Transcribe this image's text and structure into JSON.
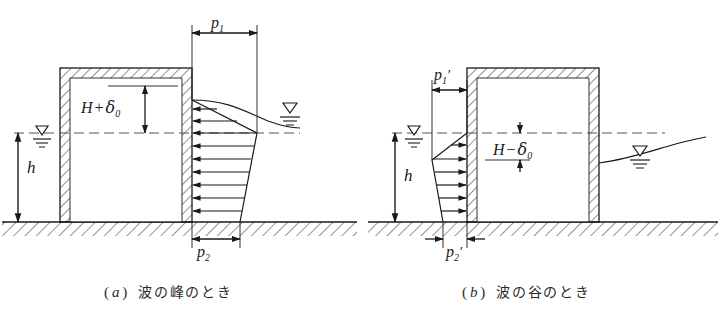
{
  "figure": {
    "title_visible": false,
    "background_color": "#ffffff",
    "line_color": "#1a1a1a"
  },
  "panel_a": {
    "caption_paren_open": "(",
    "caption_letter": "a",
    "caption_paren_close": ")",
    "caption_text": "波の峰のとき",
    "labels": {
      "p1": "p",
      "p1_sub": "1",
      "p2": "p",
      "p2_sub": "2",
      "h": "h",
      "H_term": "H",
      "operator": "+",
      "delta": "δ",
      "delta_sub": "0"
    },
    "symbols": {
      "left_water_level": "water-level-triangle",
      "right_water_level": "water-level-triangle",
      "still_water_line": "dashed",
      "ground": "hatched-ground",
      "structure": "hatched-caisson"
    }
  },
  "panel_b": {
    "caption_paren_open": "(",
    "caption_letter": "b",
    "caption_paren_close": ")",
    "caption_text": "波の谷のとき",
    "labels": {
      "p1": "p",
      "p1_sub": "1",
      "p1_prime": "′",
      "p2": "p",
      "p2_sub": "2",
      "p2_prime": "′",
      "h": "h",
      "H_term": "H",
      "operator": "−",
      "delta": "δ",
      "delta_sub": "0"
    },
    "symbols": {
      "left_water_level": "water-level-triangle",
      "right_water_level": "water-level-triangle",
      "still_water_line": "dashed",
      "ground": "hatched-ground",
      "structure": "hatched-caisson"
    }
  }
}
